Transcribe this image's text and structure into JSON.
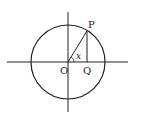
{
  "diagram": {
    "type": "unit-circle",
    "labels": {
      "origin": "O",
      "point_on_circle": "P",
      "foot_point": "Q",
      "angle": "x"
    },
    "stroke_color": "#222222",
    "background": "#ffffff"
  }
}
